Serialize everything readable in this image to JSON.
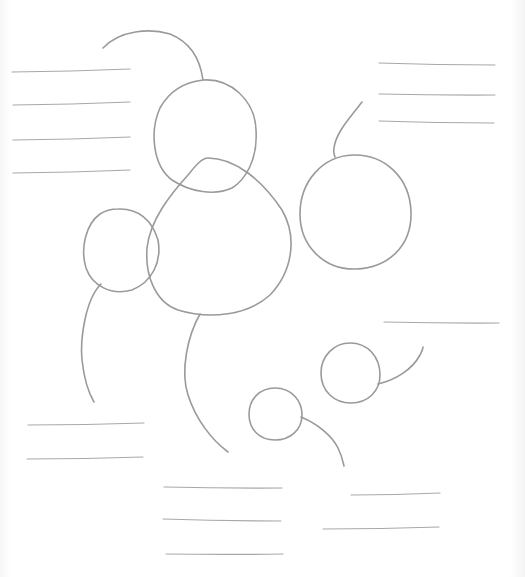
{
  "diagram": {
    "type": "hand-drawn cluster sketch",
    "stroke_color": "#9a9a9a",
    "line_color": "#a8a8a8",
    "background": "#ffffff",
    "nodes": [
      {
        "id": "top-circle",
        "d": "M203,80 C230,78 255,100 256,130 C258,160 245,180 232,188 C215,196 190,192 172,180 C152,165 150,130 160,108 C170,90 185,82 203,80 Z"
      },
      {
        "id": "center-blob",
        "d": "M208,158 C235,158 262,180 282,210 C298,238 292,272 270,295 C248,315 210,320 178,310 C155,302 145,275 147,248 C150,220 170,195 188,175 C196,165 202,158 208,158 Z"
      },
      {
        "id": "left-circle",
        "d": "M118,209 C138,208 152,220 158,240 C162,262 152,282 132,290 C110,296 92,285 86,268 C80,248 86,224 100,214 C106,210 112,209 118,209 Z"
      },
      {
        "id": "right-circle",
        "d": "M353,155 C385,154 410,178 411,212 C412,246 388,268 356,269 C324,270 300,246 300,214 C300,182 322,156 353,155 Z"
      },
      {
        "id": "small-circle-right",
        "d": "M350,343 C368,343 380,357 380,375 C380,391 368,403 351,403 C334,403 321,391 321,373 C321,356 334,343 350,343 Z"
      },
      {
        "id": "small-circle-bottom",
        "d": "M275,388 C292,388 302,401 302,415 C302,430 290,440 275,440 C260,440 249,430 249,414 C249,399 260,388 275,388 Z"
      }
    ],
    "connectors": [
      {
        "id": "top-arc",
        "d": "M103,48 C120,30 150,28 170,34 C190,42 200,58 203,80"
      },
      {
        "id": "right-stem",
        "d": "M362,102 C350,118 336,132 334,148 C333,152 334,154 335,157"
      },
      {
        "id": "left-tail",
        "d": "M101,284 C85,300 80,340 82,360 C84,378 88,392 94,402"
      },
      {
        "id": "center-tail",
        "d": "M200,314 C188,335 180,370 188,395 C196,420 212,440 228,452"
      },
      {
        "id": "small-right-tail",
        "d": "M378,384 C395,380 412,370 420,355 C422,351 423,349 423,347"
      },
      {
        "id": "small-bottom-tail",
        "d": "M301,417 C318,424 332,436 338,448 C342,456 343,462 344,466"
      }
    ],
    "text_placeholders": [
      {
        "group": "top-left",
        "lines": [
          [
            12,
            72,
            130,
            69
          ],
          [
            13,
            105,
            130,
            102
          ],
          [
            13,
            140,
            130,
            137
          ],
          [
            13,
            173,
            130,
            170
          ]
        ]
      },
      {
        "group": "top-right",
        "lines": [
          [
            379,
            63,
            495,
            65
          ],
          [
            379,
            94,
            495,
            95
          ],
          [
            379,
            121,
            494,
            123
          ]
        ]
      },
      {
        "group": "mid-right",
        "lines": [
          [
            384,
            322,
            499,
            323
          ]
        ]
      },
      {
        "group": "bottom-left",
        "lines": [
          [
            28,
            425,
            144,
            423
          ],
          [
            27,
            459,
            143,
            457
          ]
        ]
      },
      {
        "group": "bottom-center",
        "lines": [
          [
            164,
            487,
            282,
            488
          ],
          [
            163,
            519,
            281,
            521
          ],
          [
            166,
            554,
            283,
            554
          ]
        ]
      },
      {
        "group": "bottom-right",
        "lines": [
          [
            351,
            495,
            440,
            493
          ],
          [
            323,
            529,
            439,
            527
          ]
        ]
      }
    ]
  }
}
